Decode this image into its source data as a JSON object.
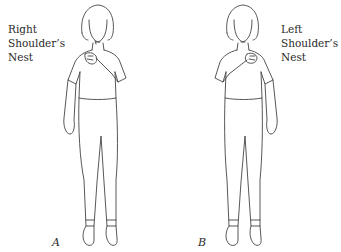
{
  "figures": [
    {
      "id": "A",
      "label": "A",
      "caption_lines": [
        "Right",
        "Shoulder’s",
        "Nest"
      ],
      "hand_position": "right hand on left chest/shoulder nest"
    },
    {
      "id": "B",
      "label": "B",
      "caption_lines": [
        "Left",
        "Shoulder’s",
        "Nest"
      ],
      "hand_position": "left hand on right chest/shoulder nest"
    }
  ],
  "colors": {
    "background": "#ffffff",
    "line": "#444444",
    "text": "#2a2a2a"
  }
}
